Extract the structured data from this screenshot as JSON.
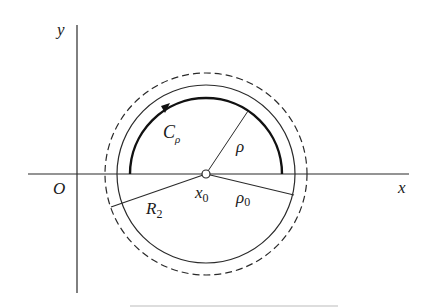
{
  "figure": {
    "labels": {
      "y_axis": "y",
      "x_axis": "x",
      "origin": "O",
      "contour": "C",
      "contour_sub": "ρ",
      "rho": "ρ",
      "center": "x",
      "center_sub": "0",
      "rho0": "ρ",
      "rho0_sub": "0",
      "R2": "R",
      "R2_sub": "2"
    },
    "colors": {
      "stroke": "#2a2a2a",
      "background": "#ffffff"
    },
    "geometry": {
      "center": [
        206,
        174
      ],
      "contour_radius": 76,
      "solid_circle_radius": 89,
      "dashed_circle_radius": 101
    }
  }
}
